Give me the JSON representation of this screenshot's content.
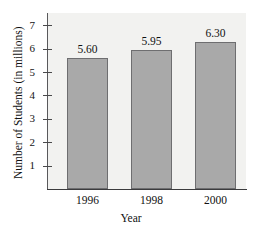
{
  "chart_data": {
    "type": "bar",
    "title": "",
    "categories": [
      "1996",
      "1998",
      "2000"
    ],
    "values": [
      5.6,
      5.95,
      6.3
    ],
    "value_labels": [
      "5.60",
      "5.95",
      "6.30"
    ],
    "xlabel": "Year",
    "ylabel": "Number of Students (in millions)",
    "ylim": [
      0,
      7.4
    ],
    "yticks": [
      1,
      2,
      3,
      4,
      5,
      6,
      7
    ],
    "ytick_labels": [
      "1",
      "2",
      "3",
      "4",
      "5",
      "6",
      "7"
    ],
    "grid": false,
    "legend": null,
    "series": [
      {
        "name": "Number of Students (in millions)",
        "values": [
          5.6,
          5.95,
          6.3
        ]
      }
    ]
  },
  "style": {
    "bar_fill": "#a9a9a9",
    "bar_border": "#6e6e70",
    "panel_background": "#f2f2f0",
    "axis_color": "#3b3b3d",
    "text_color": "#111111",
    "page_background": "#ffffff"
  }
}
